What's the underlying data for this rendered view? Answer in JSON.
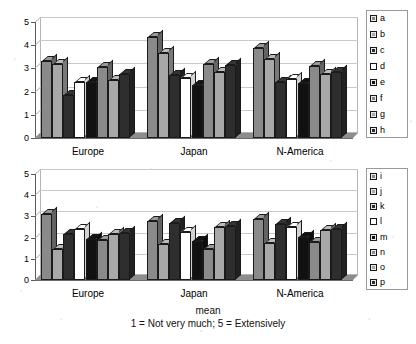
{
  "chart_data": [
    {
      "type": "bar",
      "id": "top-chart",
      "title": "",
      "xlabel": "",
      "ylabel": "",
      "ylim": [
        0,
        5
      ],
      "yticks": [
        0,
        1,
        2,
        3,
        4,
        5
      ],
      "grid": true,
      "legend_position": "right",
      "categories": [
        "Europe",
        "Japan",
        "N-America"
      ],
      "series": [
        {
          "name": "a",
          "color": "#8a8a8a",
          "values": [
            3.3,
            4.35,
            3.9
          ]
        },
        {
          "name": "b",
          "color": "#a8a8a8",
          "values": [
            3.2,
            3.65,
            3.4
          ]
        },
        {
          "name": "c",
          "color": "#2e2e2e",
          "values": [
            1.85,
            2.7,
            2.4
          ]
        },
        {
          "name": "d",
          "color": "#ffffff",
          "values": [
            2.4,
            2.6,
            2.55
          ]
        },
        {
          "name": "e",
          "color": "#111111",
          "values": [
            2.4,
            2.3,
            2.35
          ]
        },
        {
          "name": "f",
          "color": "#8a8a8a",
          "values": [
            3.05,
            3.2,
            3.1
          ]
        },
        {
          "name": "g",
          "color": "#a8a8a8",
          "values": [
            2.5,
            2.85,
            2.75
          ]
        },
        {
          "name": "h",
          "color": "#2e2e2e",
          "values": [
            2.75,
            3.15,
            2.85
          ]
        }
      ]
    },
    {
      "type": "bar",
      "id": "bottom-chart",
      "title": "",
      "xlabel": "",
      "ylabel": "",
      "ylim": [
        0,
        5
      ],
      "yticks": [
        0,
        1,
        2,
        3,
        4,
        5
      ],
      "grid": true,
      "legend_position": "right",
      "categories": [
        "Europe",
        "Japan",
        "N-America"
      ],
      "series": [
        {
          "name": "i",
          "color": "#8a8a8a",
          "values": [
            3.1,
            2.8,
            2.9
          ]
        },
        {
          "name": "j",
          "color": "#a8a8a8",
          "values": [
            1.45,
            1.7,
            1.75
          ]
        },
        {
          "name": "k",
          "color": "#2e2e2e",
          "values": [
            2.15,
            2.7,
            2.65
          ]
        },
        {
          "name": "l",
          "color": "#ffffff",
          "values": [
            2.4,
            2.25,
            2.5
          ]
        },
        {
          "name": "m",
          "color": "#111111",
          "values": [
            1.95,
            1.85,
            2.05
          ]
        },
        {
          "name": "n",
          "color": "#8a8a8a",
          "values": [
            1.9,
            1.45,
            1.8
          ]
        },
        {
          "name": "o",
          "color": "#a8a8a8",
          "values": [
            2.15,
            2.5,
            2.35
          ]
        },
        {
          "name": "p",
          "color": "#2e2e2e",
          "values": [
            2.2,
            2.55,
            2.4
          ]
        }
      ]
    }
  ],
  "caption": {
    "line1": "mean",
    "line2": "1 = Not very much; 5 = Extensively"
  }
}
